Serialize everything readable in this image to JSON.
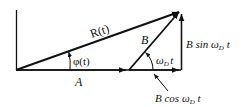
{
  "diagram": {
    "type": "phasor-diagram",
    "labels": {
      "R": "R(t)",
      "phi": "φ(t)",
      "A": "A",
      "B": "B",
      "omega_t": "ωD t",
      "omega_t_main": "ω",
      "omega_t_sub": "D",
      "omega_t_t": "t",
      "sin_prefix": "B sin ω",
      "sin_sub": "D",
      "sin_t": " t",
      "cos_prefix": "B cos ω",
      "cos_sub": "D",
      "cos_t": " t"
    },
    "colors": {
      "stroke": "#111111",
      "background": "#ffffff"
    }
  }
}
